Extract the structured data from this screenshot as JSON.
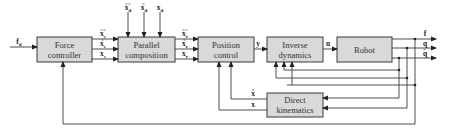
{
  "diagram": {
    "type": "block-diagram",
    "blocks": {
      "force_controller": {
        "line1": "Force",
        "line2": "controller"
      },
      "parallel_composition": {
        "line1": "Parallel",
        "line2": "composition"
      },
      "position_control": {
        "line1": "Position",
        "line2": "control"
      },
      "inverse_dynamics": {
        "line1": "Inverse",
        "line2": "dynamics"
      },
      "robot": {
        "line1": "Robot"
      },
      "direct_kinematics": {
        "line1": "Direct",
        "line2": "kinematics"
      }
    },
    "signals": {
      "fd": "f",
      "fd_sub": "d",
      "xc_ddot": "x",
      "xc_dot": "x",
      "xc": "x",
      "c_sub": "c",
      "xd_ddot": "x",
      "xd_dot": "x",
      "xd": "x",
      "d_sub": "d",
      "xr_ddot": "x",
      "xr_dot": "x",
      "xr": "x",
      "r_sub": "r",
      "y": "y",
      "u": "u",
      "f": "f",
      "q": "q",
      "q_dot": "q",
      "x_dot_fb": "x",
      "x_fb": "x"
    }
  }
}
